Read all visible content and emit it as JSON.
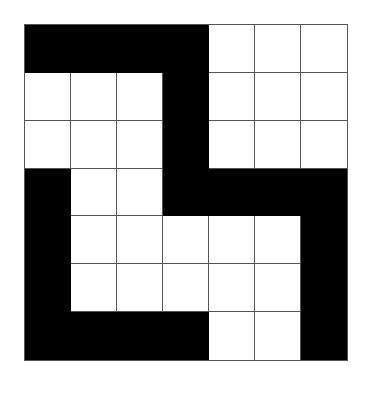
{
  "diagram": {
    "type": "grid-pattern",
    "rows": 7,
    "cols": 7,
    "colors": {
      "filled": "#000000",
      "empty": "#ffffff",
      "gridline": "#555555"
    },
    "cells": [
      [
        1,
        1,
        1,
        1,
        0,
        0,
        0
      ],
      [
        0,
        0,
        0,
        1,
        0,
        0,
        0
      ],
      [
        0,
        0,
        0,
        1,
        0,
        0,
        0
      ],
      [
        1,
        0,
        0,
        1,
        1,
        1,
        1
      ],
      [
        1,
        0,
        0,
        0,
        0,
        0,
        1
      ],
      [
        1,
        0,
        0,
        0,
        0,
        0,
        1
      ],
      [
        1,
        1,
        1,
        1,
        0,
        0,
        1
      ]
    ]
  }
}
